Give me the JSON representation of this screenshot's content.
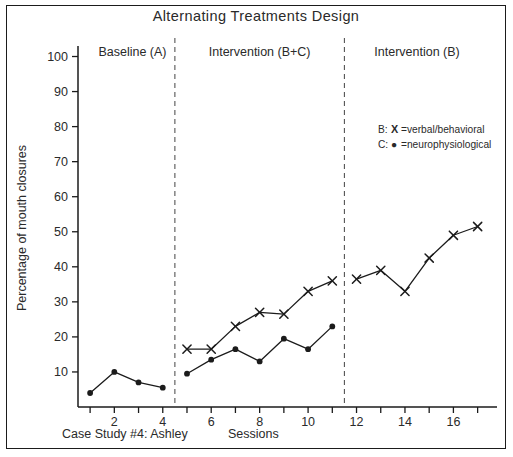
{
  "figure": {
    "title": "Alternating Treatments Design",
    "footer_left": "Case Study #4: Ashley",
    "footer_center": "Sessions"
  },
  "legend": {
    "row_b_prefix": "B:",
    "row_b_marker": "X",
    "row_b_label": "=verbal/behavioral",
    "row_c_prefix": "C:",
    "row_c_marker": "●",
    "row_c_label": "=neurophysiological"
  },
  "phases": [
    {
      "label": "Baseline (A)",
      "start": 1,
      "end": 4.5
    },
    {
      "label": "Intervention (B+C)",
      "start": 4.5,
      "end": 11.5
    },
    {
      "label": "Intervention (B)",
      "start": 11.5,
      "end": 17.5
    }
  ],
  "dividers": [
    4.5,
    11.5
  ],
  "colors": {
    "ink": "#1b1b1b",
    "divider": "#555555",
    "background": "#ffffff"
  },
  "chart_data": {
    "type": "line",
    "title": "Alternating Treatments Design",
    "xlabel": "Sessions",
    "ylabel": "Percentage of mouth closures",
    "xlim": [
      0.5,
      17.8
    ],
    "ylim": [
      0,
      103
    ],
    "grid": false,
    "legend_position": "upper-right-inside",
    "yticks": [
      10,
      20,
      30,
      40,
      50,
      60,
      70,
      80,
      90,
      100
    ],
    "ytick_labels": [
      "10",
      "20",
      "30",
      "40",
      "50",
      "60",
      "70",
      "80",
      "90",
      "100"
    ],
    "xticks": [
      1,
      2,
      3,
      4,
      5,
      6,
      7,
      8,
      9,
      10,
      11,
      12,
      13,
      14,
      15,
      16,
      17
    ],
    "xtick_labels": [
      "",
      "2",
      "",
      "4",
      "",
      "6",
      "",
      "8",
      "",
      "10",
      "",
      "12",
      "",
      "14",
      "",
      "16",
      ""
    ],
    "series": [
      {
        "name": "C: neurophysiological",
        "marker": "dot",
        "segments": [
          {
            "phase": "Baseline (A)",
            "x": [
              1,
              2,
              3,
              4
            ],
            "y": [
              4,
              10,
              7,
              5.5
            ]
          },
          {
            "phase": "Intervention (B+C)",
            "x": [
              5,
              6,
              7,
              8,
              9,
              10,
              11
            ],
            "y": [
              9.5,
              13.5,
              16.5,
              13,
              19.5,
              16.5,
              23
            ]
          }
        ]
      },
      {
        "name": "B: verbal/behavioral",
        "marker": "x",
        "segments": [
          {
            "phase": "Intervention (B+C)",
            "x": [
              5,
              6,
              7,
              8,
              9,
              10,
              11
            ],
            "y": [
              16.5,
              16.5,
              23,
              27,
              26.5,
              33,
              36
            ]
          },
          {
            "phase": "Intervention (B)",
            "x": [
              12,
              13,
              14,
              15,
              16,
              17
            ],
            "y": [
              36.5,
              39,
              33,
              42.5,
              49,
              51.5
            ]
          }
        ]
      }
    ]
  }
}
